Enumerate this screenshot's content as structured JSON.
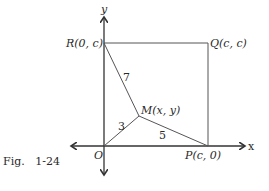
{
  "figure": {
    "caption": "Fig.   1-24",
    "axes": {
      "x_label": "x",
      "y_label": "y"
    },
    "points": {
      "O": {
        "label": "O"
      },
      "P": {
        "label": "P(c, 0)"
      },
      "Q": {
        "label": "Q(c, c)"
      },
      "R": {
        "label": "R(0, c)"
      },
      "M": {
        "label": "M(x, y)"
      }
    },
    "segments": {
      "OM": {
        "length_label": "3"
      },
      "PM": {
        "length_label": "5"
      },
      "RM": {
        "length_label": "7"
      }
    },
    "colors": {
      "line": "#555555",
      "text": "#2a2a2a"
    }
  }
}
